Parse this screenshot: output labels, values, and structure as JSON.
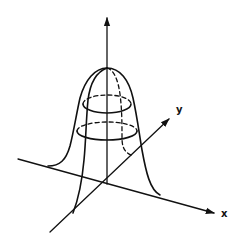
{
  "figure": {
    "axes": {
      "x": {
        "label": "x"
      },
      "y": {
        "label": "y"
      },
      "z": {
        "label": ""
      }
    },
    "surface": {
      "type": "2D Gaussian bell",
      "contour_ellipses": 2,
      "hidden_lines": "dashed"
    },
    "colors": {
      "ink": "#111111",
      "background": "#ffffff"
    }
  }
}
